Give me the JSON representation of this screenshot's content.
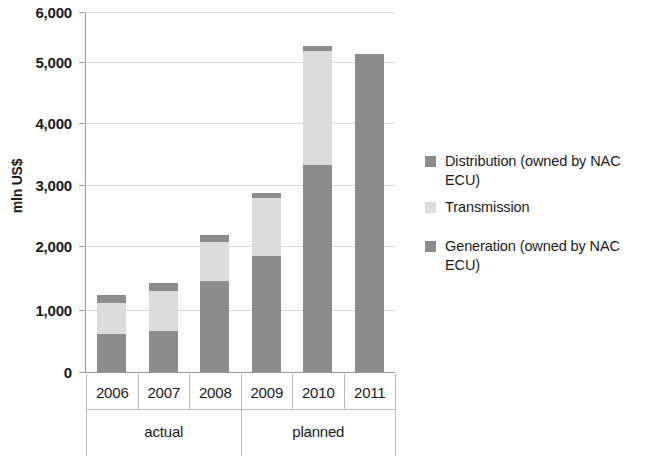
{
  "chart_data": {
    "type": "bar",
    "subtype": "stacked-bar",
    "title": "",
    "xlabel": "",
    "ylabel": "mln US$",
    "ylim": [
      0,
      6000
    ],
    "ytick_labels": [
      "6,000",
      "5,000",
      "4,000",
      "3,000",
      "2,000",
      "1,000",
      "0"
    ],
    "ytick_values": [
      6000,
      5000,
      4000,
      3000,
      2000,
      1000,
      0
    ],
    "grid": true,
    "legend_position": "right",
    "categories": [
      "2006",
      "2007",
      "2008",
      "2009",
      "2010",
      "2011"
    ],
    "group_labels": [
      "actual",
      "planned"
    ],
    "groups": [
      {
        "label": "actual",
        "categories": [
          "2006",
          "2007",
          "2008"
        ]
      },
      {
        "label": "planned",
        "categories": [
          "2009",
          "2010",
          "2011"
        ]
      }
    ],
    "series": [
      {
        "name": "Generation (owned by NAC ECU)",
        "color": "#8c8c8c",
        "values": [
          630,
          680,
          1520,
          1940,
          3450,
          5300
        ]
      },
      {
        "name": "Transmission",
        "color": "#dcdcdc",
        "values": [
          520,
          670,
          640,
          960,
          1900,
          0
        ]
      },
      {
        "name": "Distribution (owned by NAC ECU)",
        "color": "#8c8c8c",
        "values": [
          130,
          130,
          130,
          80,
          90,
          0
        ]
      }
    ],
    "totals": [
      1280,
      1480,
      2290,
      2980,
      5440,
      5300
    ]
  },
  "legend": {
    "items": [
      {
        "label": "Distribution (owned by NAC ECU)",
        "color": "#8c8c8c"
      },
      {
        "label": "Transmission",
        "color": "#dcdcdc"
      },
      {
        "label": "Generation (owned by NAC ECU)",
        "color": "#8c8c8c"
      }
    ]
  },
  "axis": {
    "y_title": "mln US$",
    "y_ticks": [
      "6,000",
      "5,000",
      "4,000",
      "3,000",
      "2,000",
      "1,000",
      "0"
    ],
    "x_ticks": [
      "2006",
      "2007",
      "2008",
      "2009",
      "2010",
      "2011"
    ],
    "x_groups": [
      "actual",
      "planned"
    ]
  }
}
